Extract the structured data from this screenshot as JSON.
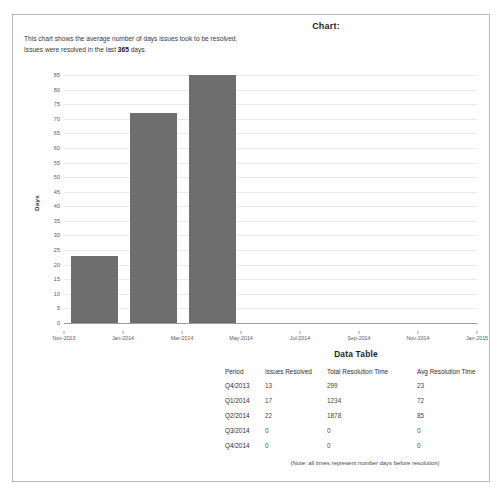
{
  "page": {
    "title": "Chart:",
    "description_line1": "This chart shows the average number of days issues took to be resolved.",
    "description_prefix": "Issues were resolved in the last ",
    "description_days": "365",
    "description_suffix": " days.",
    "bar_color": "#6e6e6e",
    "grid_color": "#e9e9e9",
    "axis_color": "#9c9c9c",
    "border_color": "#b9b9b9"
  },
  "chart_data": {
    "type": "bar",
    "title": "Chart:",
    "xlabel": "",
    "ylabel": "Days",
    "ylim": [
      0,
      85
    ],
    "ytick_step": 5,
    "yticks": [
      0,
      5,
      10,
      15,
      20,
      25,
      30,
      35,
      40,
      45,
      50,
      55,
      60,
      65,
      70,
      75,
      80,
      85
    ],
    "xticks": [
      "Nov-2013",
      "Jan-2014",
      "Mar-2014",
      "May-2014",
      "Jul-2014",
      "Sep-2014",
      "Nov-2014",
      "Jan-2015"
    ],
    "grid": true,
    "legend": false,
    "categories": [
      "Q4/2013",
      "Q1/2014",
      "Q2/2014"
    ],
    "values": [
      23,
      72,
      85
    ],
    "bars": [
      {
        "label": "Q4/2013",
        "value": 23
      },
      {
        "label": "Q1/2014",
        "value": 72
      },
      {
        "label": "Q2/2014",
        "value": 85
      }
    ]
  },
  "data_table": {
    "title": "Data Table",
    "columns": [
      "Period",
      "Issues Resolved",
      "Total Resolution Time",
      "Avg  Resolution Time"
    ],
    "rows": [
      {
        "period": "Q4/2013",
        "issues_resolved": "13",
        "total_resolution_time": "299",
        "avg_resolution_time": "23"
      },
      {
        "period": "Q1/2014",
        "issues_resolved": "17",
        "total_resolution_time": "1234",
        "avg_resolution_time": "72"
      },
      {
        "period": "Q2/2014",
        "issues_resolved": "22",
        "total_resolution_time": "1878",
        "avg_resolution_time": "85"
      },
      {
        "period": "Q3/2014",
        "issues_resolved": "0",
        "total_resolution_time": "0",
        "avg_resolution_time": "0"
      },
      {
        "period": "Q4/2014",
        "issues_resolved": "0",
        "total_resolution_time": "0",
        "avg_resolution_time": "0"
      }
    ],
    "note": "(Note: all times represent number days before resolution)"
  }
}
